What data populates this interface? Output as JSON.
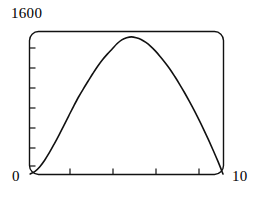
{
  "chart_data": {
    "type": "line",
    "title": "",
    "xlabel": "",
    "ylabel": "",
    "xlim": [
      0,
      10
    ],
    "ylim": [
      0,
      1600
    ],
    "grid": false,
    "legend": null,
    "frame": "rounded-box",
    "x_tick_labels": [
      "0",
      "10"
    ],
    "y_tick_labels": [
      "0",
      "1600"
    ],
    "x_minor_tick_count": 4,
    "y_minor_tick_count": 7,
    "line_color": "#111111",
    "line_width": 1.6,
    "series": [
      {
        "name": "curve",
        "x": [
          0.0,
          0.25,
          0.5,
          0.75,
          1.0,
          1.25,
          1.5,
          1.75,
          2.0,
          2.25,
          2.5,
          2.75,
          3.0,
          3.25,
          3.5,
          3.75,
          4.0,
          4.25,
          4.5,
          4.75,
          5.0,
          5.25,
          5.5,
          5.75,
          6.0,
          6.25,
          6.5,
          6.75,
          7.0,
          7.25,
          7.5,
          7.75,
          8.0,
          8.25,
          8.5,
          8.75,
          9.0,
          9.25,
          9.5,
          9.75,
          10.0
        ],
        "y": [
          0,
          30,
          85,
          160,
          250,
          350,
          455,
          565,
          675,
          785,
          890,
          985,
          1075,
          1165,
          1250,
          1325,
          1390,
          1450,
          1510,
          1555,
          1580,
          1590,
          1580,
          1560,
          1525,
          1480,
          1425,
          1360,
          1290,
          1215,
          1130,
          1040,
          945,
          845,
          740,
          630,
          515,
          395,
          270,
          140,
          0
        ]
      }
    ]
  },
  "labels": {
    "y_max": "1600",
    "y_min": "0",
    "x_max": "10"
  }
}
